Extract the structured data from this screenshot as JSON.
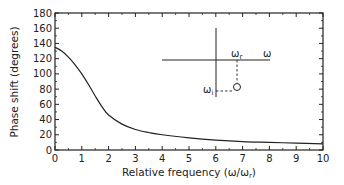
{
  "chart_data": {
    "type": "line",
    "title": "",
    "xlabel": "Relative frequency (ω/ωr)",
    "ylabel": "Phase shift (degrees)",
    "xlim": [
      0,
      10
    ],
    "ylim": [
      0,
      180
    ],
    "xticks": [
      0,
      1,
      2,
      3,
      4,
      5,
      6,
      7,
      8,
      9,
      10
    ],
    "yticks": [
      0,
      20,
      40,
      60,
      80,
      100,
      120,
      140,
      160,
      180
    ],
    "grid": false,
    "legend": null,
    "series": [
      {
        "name": "Phase shift",
        "x": [
          0,
          0.25,
          0.5,
          0.75,
          1.0,
          1.25,
          1.5,
          1.75,
          2.0,
          2.5,
          3.0,
          3.5,
          4.0,
          5.0,
          6.0,
          7.0,
          8.0,
          9.0,
          10.0
        ],
        "values": [
          135,
          130,
          122,
          112,
          100,
          86,
          71,
          57,
          46,
          34,
          27,
          23,
          20,
          16,
          13,
          11,
          10,
          9,
          8
        ]
      }
    ],
    "annotations": {
      "inset_diagram": {
        "description": "complex frequency plane sketch",
        "real_axis_label": "ω",
        "resonance_label": "ωr",
        "imag_label": "ωi"
      }
    }
  },
  "labels": {
    "xlabel_main": "Relative frequency (ω/ω",
    "xlabel_sub": "r",
    "xlabel_close": ")",
    "ylabel": "Phase shift (degrees)",
    "inset_omega": "ω",
    "inset_omega_r": "ω",
    "inset_omega_r_sub": "r",
    "inset_omega_i": "ω",
    "inset_omega_i_sub": "i"
  }
}
